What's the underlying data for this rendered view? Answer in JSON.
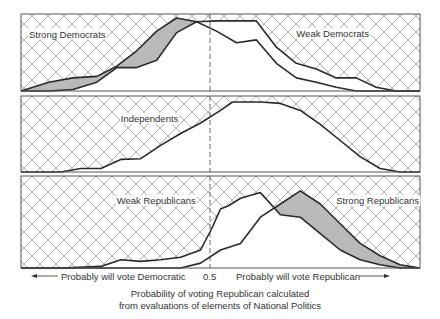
{
  "chart_data": {
    "type": "area",
    "title": "",
    "xlabel": "Probability of voting Republican calculated from evaluations of elements of National Politics",
    "ylabel": "",
    "xlim": [
      0,
      1
    ],
    "reference_line": {
      "x": 0.5,
      "style": "dashed"
    },
    "axis_annotations": {
      "left": "Probably will vote Democratic",
      "center": "0.5",
      "right": "Probably will vote Republican"
    },
    "panels": [
      {
        "name": "Democrats",
        "series": [
          {
            "name": "Strong Democrats",
            "fill": "gray",
            "x": [
              0.0,
              0.07,
              0.13,
              0.19,
              0.24,
              0.29,
              0.34,
              0.39,
              0.44,
              0.49,
              0.54,
              0.59,
              0.64,
              0.69,
              0.74,
              0.79,
              0.84,
              0.89,
              0.94,
              1.0
            ],
            "y": [
              0.0,
              0.12,
              0.18,
              0.2,
              0.34,
              0.55,
              0.82,
              1.0,
              0.95,
              0.82,
              0.66,
              0.7,
              0.38,
              0.18,
              0.12,
              0.05,
              0.0,
              0.0,
              0.0,
              0.0
            ]
          },
          {
            "name": "Weak Democrats",
            "fill": "white",
            "x": [
              0.0,
              0.07,
              0.13,
              0.19,
              0.24,
              0.29,
              0.34,
              0.39,
              0.44,
              0.49,
              0.54,
              0.59,
              0.64,
              0.69,
              0.74,
              0.79,
              0.84,
              0.89,
              0.94,
              1.0
            ],
            "y": [
              0.0,
              0.0,
              0.02,
              0.12,
              0.32,
              0.32,
              0.42,
              0.8,
              0.95,
              0.96,
              0.96,
              0.96,
              0.6,
              0.38,
              0.3,
              0.18,
              0.18,
              0.05,
              0.0,
              0.0
            ]
          }
        ],
        "labels": [
          {
            "text": "Strong Democrats",
            "x": 0.02,
            "y": 0.73
          },
          {
            "text": "Weak Democrats",
            "x": 0.69,
            "y": 0.74
          }
        ]
      },
      {
        "name": "Independents",
        "series": [
          {
            "name": "Independents",
            "fill": "white",
            "x": [
              0.0,
              0.1,
              0.15,
              0.2,
              0.25,
              0.3,
              0.35,
              0.4,
              0.45,
              0.5,
              0.53,
              0.6,
              0.65,
              0.7,
              0.75,
              0.8,
              0.85,
              0.9,
              0.95,
              1.0
            ],
            "y": [
              0.0,
              0.0,
              0.05,
              0.05,
              0.18,
              0.19,
              0.38,
              0.55,
              0.7,
              0.88,
              1.0,
              1.0,
              0.98,
              0.88,
              0.68,
              0.45,
              0.22,
              0.05,
              0.0,
              0.0
            ]
          }
        ],
        "labels": [
          {
            "text": "Independents",
            "x": 0.25,
            "y": 0.72
          }
        ]
      },
      {
        "name": "Republicans",
        "series": [
          {
            "name": "Strong Republicans",
            "fill": "gray",
            "x": [
              0.0,
              0.3,
              0.35,
              0.4,
              0.45,
              0.5,
              0.55,
              0.6,
              0.65,
              0.7,
              0.75,
              0.8,
              0.85,
              0.9,
              0.95,
              1.0
            ],
            "y": [
              0.0,
              0.0,
              0.0,
              0.0,
              0.06,
              0.22,
              0.3,
              0.62,
              0.78,
              0.94,
              0.78,
              0.54,
              0.3,
              0.15,
              0.04,
              0.0
            ],
            "note": "peak near x=0.69"
          },
          {
            "name": "Weak Republicans",
            "fill": "white",
            "x": [
              0.0,
              0.1,
              0.2,
              0.25,
              0.3,
              0.35,
              0.4,
              0.45,
              0.48,
              0.5,
              0.52,
              0.55,
              0.6,
              0.65,
              0.7,
              0.75,
              0.8,
              0.85,
              0.9,
              0.95,
              1.0
            ],
            "y": [
              0.0,
              0.0,
              0.02,
              0.1,
              0.08,
              0.1,
              0.13,
              0.22,
              0.5,
              0.72,
              0.76,
              0.85,
              0.92,
              0.65,
              0.62,
              0.42,
              0.22,
              0.1,
              0.04,
              0.0,
              0.0
            ]
          }
        ],
        "labels": [
          {
            "text": "Weak Republicans",
            "x": 0.24,
            "y": 0.78
          },
          {
            "text": "Strong Republicans",
            "x": 0.79,
            "y": 0.78
          }
        ]
      }
    ],
    "grid": false,
    "legend": "inline labels"
  },
  "axis": {
    "left_label": "Probably will vote Democratic",
    "center_label": "0.5",
    "right_label": "Probably will vote Republican"
  },
  "caption": {
    "line1": "Probability of voting Republican calculated",
    "line2": "from evaluations of elements of National Politics"
  },
  "colors": {
    "gray_fill": "#b9b9b9",
    "line": "#2a2a2a",
    "hatch": "#9a9a9a",
    "frame": "#555555"
  }
}
